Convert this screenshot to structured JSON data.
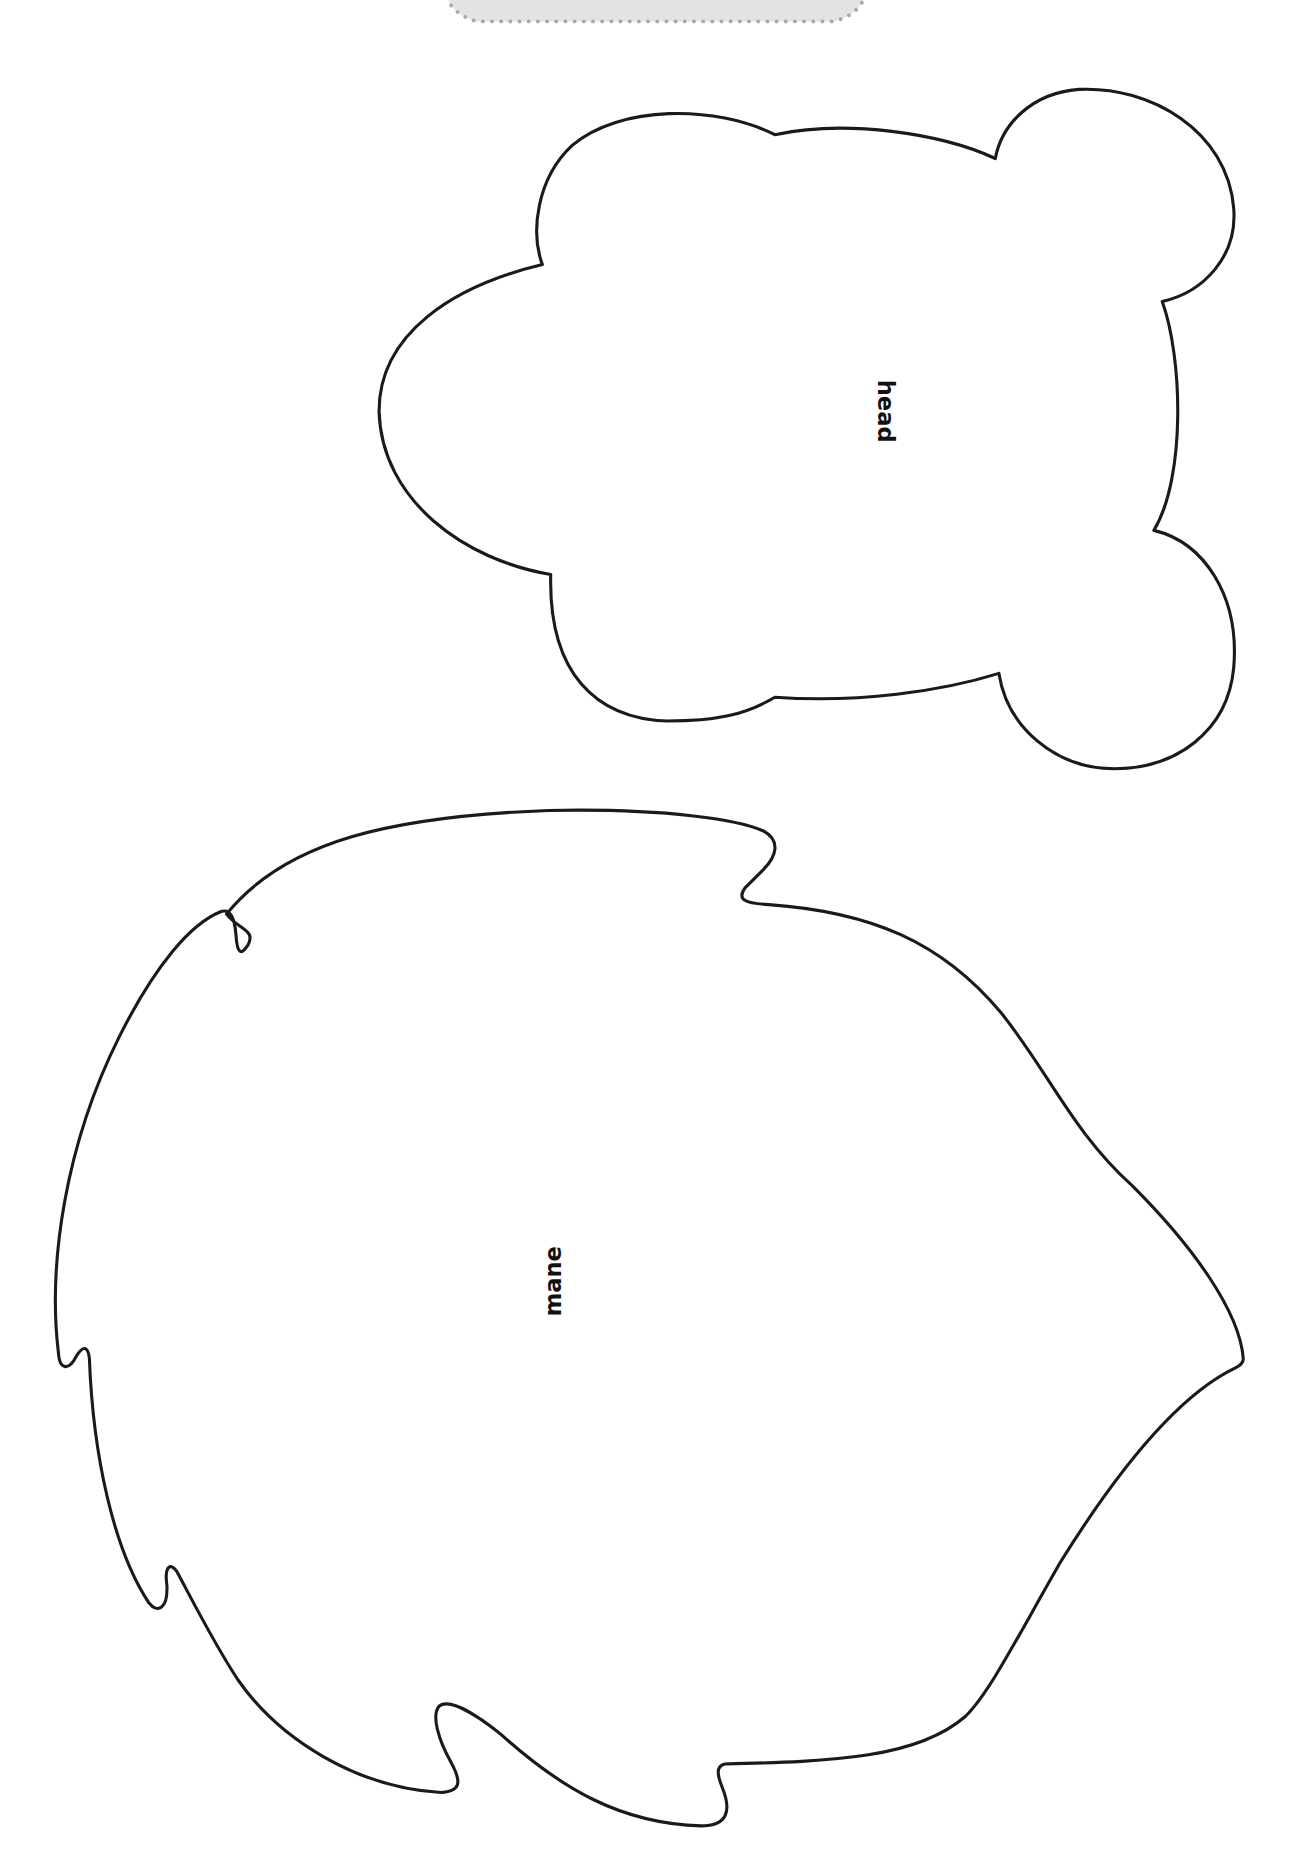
{
  "page": {
    "type": "printable craft template",
    "background": "#ffffff",
    "outline_color": "#1a1a1a",
    "tab_fill": "#e3e3e3",
    "tab_dots_color": "#a9a9a9"
  },
  "pieces": [
    {
      "id": "head",
      "label": "head",
      "shape": "rounded head with two ears",
      "label_rotation_deg": 90
    },
    {
      "id": "mane",
      "label": "mane",
      "shape": "jagged lion mane",
      "label_rotation_deg": -90
    }
  ]
}
